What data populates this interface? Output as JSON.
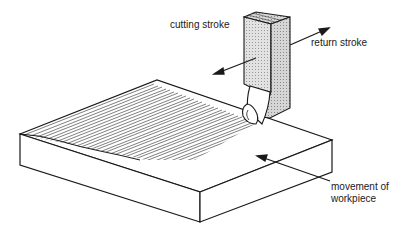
{
  "figure": {
    "labels": {
      "cutting_stroke": "cutting stroke",
      "return_stroke": "return stroke",
      "movement_line1": "movement of",
      "movement_line2": "workpiece"
    },
    "colors": {
      "line": "#1a1a1a",
      "tool_shade": "#d4d4d4",
      "tool_side_shade": "#c2c2c2",
      "background": "#ffffff"
    }
  }
}
